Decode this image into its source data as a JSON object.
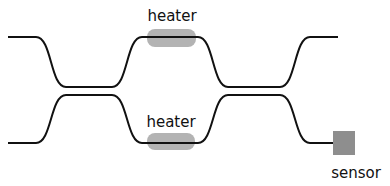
{
  "diagram": {
    "type": "interferometer-schematic",
    "labels": {
      "top_heater": "heater",
      "bottom_heater": "heater",
      "sensor": "sensor"
    },
    "colors": {
      "waveguide": "#111111",
      "heater": "#b3b3b3",
      "sensor": "#8e8e8e",
      "background": "#ffffff"
    },
    "components": [
      {
        "name": "top-waveguide",
        "kind": "waveguide"
      },
      {
        "name": "bottom-waveguide",
        "kind": "waveguide"
      },
      {
        "name": "coupler-1",
        "kind": "directional-coupler"
      },
      {
        "name": "coupler-2",
        "kind": "directional-coupler"
      },
      {
        "name": "top-heater",
        "kind": "heater"
      },
      {
        "name": "bottom-heater",
        "kind": "heater"
      },
      {
        "name": "sensor",
        "kind": "detector"
      }
    ]
  }
}
